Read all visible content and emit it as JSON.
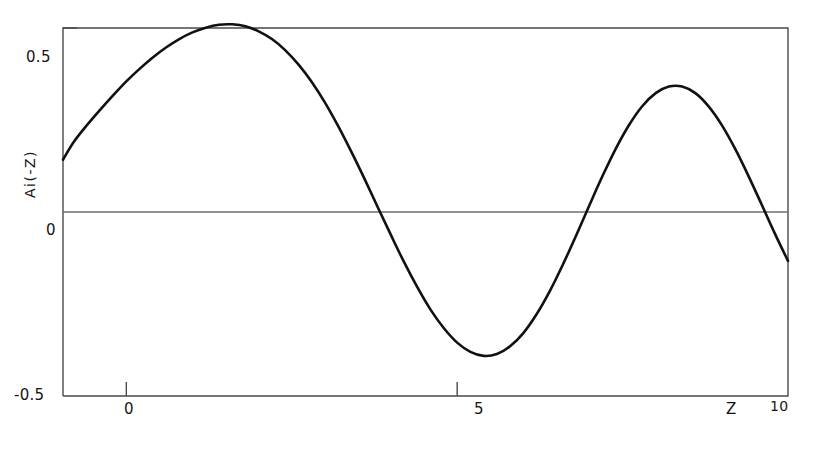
{
  "figure": {
    "background": "#ffffff",
    "curve_color": "#111111",
    "frame_color": "#4a4a4a",
    "zeroline_color": "#6e6e6e"
  },
  "axes": {
    "y_title": "Ai(-Z)",
    "x_title": "Z",
    "y_ticks": [
      {
        "value": 0.5,
        "label": "0.5"
      },
      {
        "value": 0.0,
        "label": "0"
      },
      {
        "value": -0.5,
        "label": "-0.5"
      }
    ],
    "x_ticks": [
      {
        "value": 0,
        "label": "0"
      },
      {
        "value": 5,
        "label": "5"
      },
      {
        "value": 10,
        "label": "10"
      }
    ]
  },
  "chart_data": {
    "type": "line",
    "title": "",
    "subtitle": "",
    "xlabel": "Z",
    "ylabel": "Ai(-Z)",
    "xlim": [
      -0.957,
      10.0
    ],
    "ylim": [
      -0.5,
      0.5
    ],
    "xticks": [
      0,
      5,
      10
    ],
    "yticks": [
      -0.5,
      0,
      0.5
    ],
    "xticklabels": [
      "0",
      "5",
      "10"
    ],
    "yticklabels": [
      "-0.5",
      "0",
      "0.5"
    ],
    "grid": false,
    "legend": null,
    "zero_line": 0.0,
    "series": [
      {
        "name": "Ai(-Z)",
        "color": "#111111",
        "linewidth": 2.6,
        "x": [
          -0.957,
          -0.8,
          -0.6,
          -0.4,
          -0.2,
          0.0,
          0.2,
          0.4,
          0.6,
          0.8,
          1.0,
          1.2,
          1.4,
          1.6,
          1.8,
          2.0,
          2.2,
          2.4,
          2.6,
          2.8,
          3.0,
          3.2,
          3.4,
          3.6,
          3.8,
          4.0,
          4.2,
          4.4,
          4.6,
          4.8,
          5.0,
          5.2,
          5.4,
          5.6,
          5.8,
          6.0,
          6.2,
          6.4,
          6.6,
          6.8,
          7.0,
          7.2,
          7.4,
          7.6,
          7.8,
          8.0,
          8.2,
          8.4,
          8.6,
          8.8,
          9.0,
          9.2,
          9.4,
          9.6,
          9.8,
          10.0
        ],
        "y": [
          0.142,
          0.189,
          0.235,
          0.277,
          0.317,
          0.355,
          0.389,
          0.42,
          0.447,
          0.47,
          0.488,
          0.501,
          0.509,
          0.51,
          0.505,
          0.491,
          0.47,
          0.44,
          0.401,
          0.354,
          0.298,
          0.234,
          0.164,
          0.09,
          0.013,
          -0.063,
          -0.137,
          -0.205,
          -0.266,
          -0.316,
          -0.355,
          -0.38,
          -0.391,
          -0.386,
          -0.365,
          -0.329,
          -0.278,
          -0.215,
          -0.142,
          -0.063,
          0.019,
          0.099,
          0.173,
          0.237,
          0.288,
          0.323,
          0.341,
          0.341,
          0.323,
          0.287,
          0.236,
          0.172,
          0.099,
          0.021,
          -0.058,
          -0.133
        ],
        "extrema": [
          {
            "kind": "start",
            "x": -0.957,
            "y": 0.142
          },
          {
            "kind": "max",
            "x": 1.47,
            "y": 0.536
          },
          {
            "kind": "zero",
            "x": 2.338,
            "y": 0.0
          },
          {
            "kind": "min",
            "x": 3.25,
            "y": -0.419
          },
          {
            "kind": "zero",
            "x": 4.088,
            "y": 0.0
          },
          {
            "kind": "max",
            "x": 4.82,
            "y": 0.38
          },
          {
            "kind": "zero",
            "x": 5.521,
            "y": 0.0
          },
          {
            "kind": "min",
            "x": 6.16,
            "y": -0.358
          },
          {
            "kind": "zero",
            "x": 6.787,
            "y": 0.0
          },
          {
            "kind": "max",
            "x": 7.37,
            "y": 0.338
          },
          {
            "kind": "zero",
            "x": 7.944,
            "y": 0.0
          },
          {
            "kind": "min",
            "x": 8.49,
            "y": -0.322
          },
          {
            "kind": "zero",
            "x": 9.023,
            "y": 0.0
          },
          {
            "kind": "max",
            "x": 9.54,
            "y": 0.31
          },
          {
            "kind": "end",
            "x": 10.0,
            "y": 0.052
          }
        ]
      }
    ]
  }
}
